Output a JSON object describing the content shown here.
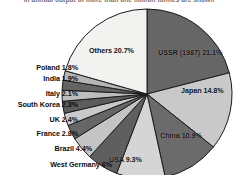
{
  "caption": "in annual output of more than one million tonnes are shown",
  "chart_data": {
    "type": "pie",
    "title": "",
    "subtitle": "",
    "xlabel": "",
    "ylabel": "",
    "legend": "none",
    "grid": false,
    "start_angle_deg": 0,
    "direction": "clockwise",
    "labels": [
      "USSR (1987)",
      "Japan",
      "China",
      "USA",
      "West Germany",
      "Brazil",
      "France",
      "UK",
      "South Korea",
      "Italy",
      "India",
      "Poland",
      "Others"
    ],
    "values": [
      21.1,
      14.8,
      10.9,
      9.3,
      6.0,
      4.4,
      2.8,
      2.4,
      2.3,
      2.1,
      1.9,
      1.8,
      20.7
    ],
    "value_suffix": "%",
    "slices": [
      {
        "name": "USSR (1987)",
        "value": 21.1,
        "label": "USSR (1987) 21.1%",
        "color": "#666666",
        "label_placement": "inside"
      },
      {
        "name": "Japan",
        "value": 14.8,
        "label": "Japan 14.8%",
        "color": "#c9c9c9",
        "label_placement": "inside"
      },
      {
        "name": "China",
        "value": 10.9,
        "label": "China 10.9%",
        "color": "#6b6b6b",
        "label_placement": "inside"
      },
      {
        "name": "USA",
        "value": 9.3,
        "label": "USA 9.3%",
        "color": "#d5d5d5",
        "label_placement": "inside"
      },
      {
        "name": "West Germany",
        "value": 6.0,
        "label": "West Germany 6%",
        "color": "#5f5f5f",
        "label_placement": "callout"
      },
      {
        "name": "Brazil",
        "value": 4.4,
        "label": "Brazil 4.4%",
        "color": "#c4c4c4",
        "label_placement": "callout"
      },
      {
        "name": "France",
        "value": 2.8,
        "label": "France 2.8%",
        "color": "#666666",
        "label_placement": "callout"
      },
      {
        "name": "UK",
        "value": 2.4,
        "label": "UK 2.4%",
        "color": "#c9c9c9",
        "label_placement": "callout"
      },
      {
        "name": "South Korea",
        "value": 2.3,
        "label": "South Korea 2.3%",
        "color": "#5c5c5c",
        "label_placement": "callout"
      },
      {
        "name": "Italy",
        "value": 2.1,
        "label": "Italy 2.1%",
        "color": "#bdbdbd",
        "label_placement": "callout"
      },
      {
        "name": "India",
        "value": 1.9,
        "label": "India 1.9%",
        "color": "#646464",
        "label_placement": "callout"
      },
      {
        "name": "Poland",
        "value": 1.8,
        "label": "Poland 1.8%",
        "color": "#b5b5b5",
        "label_placement": "callout"
      },
      {
        "name": "Others",
        "value": 20.7,
        "label": "Others 20.7%",
        "color": "#f2f2f0",
        "label_placement": "inside"
      }
    ],
    "colors": {
      "outline": "#1b1b1b",
      "dark_slice": "#666666",
      "light_slice": "#cccccc",
      "others_slice": "#f2f2f0",
      "background": "#ffffff"
    }
  },
  "geometry": {
    "center_x": 147,
    "center_y": 94,
    "radius": 85
  },
  "inside_labels": [
    {
      "key": "ussr",
      "text": "USSR (1987) 21.1%",
      "x": 158,
      "y": 48
    },
    {
      "key": "japan",
      "text": "Japan 14.8%",
      "x": 181,
      "y": 86
    },
    {
      "key": "china",
      "text": "China 10.9%",
      "x": 160,
      "y": 131
    },
    {
      "key": "usa",
      "text": "USA 9.3%",
      "x": 109,
      "y": 155
    },
    {
      "key": "others",
      "text": "Others 20.7%",
      "x": 89,
      "y": 46
    }
  ],
  "callout_labels": [
    {
      "key": "poland",
      "text": "Poland 1.8%",
      "x": 14,
      "y": 63
    },
    {
      "key": "india",
      "text": "India 1.9%",
      "x": 20,
      "y": 74
    },
    {
      "key": "italy",
      "text": "Italy 2.1%",
      "x": 22,
      "y": 89
    },
    {
      "key": "south-korea",
      "text": "South Korea 2.3%",
      "x": 2,
      "y": 100
    },
    {
      "key": "uk",
      "text": "UK 2.4%",
      "x": 30,
      "y": 115
    },
    {
      "key": "france",
      "text": "France 2.8%",
      "x": 18,
      "y": 129
    },
    {
      "key": "brazil",
      "text": "Brazil 4.4%",
      "x": 23,
      "y": 144
    },
    {
      "key": "west-germany",
      "text": "West Germany 6%",
      "x": 6,
      "y": 160
    }
  ]
}
